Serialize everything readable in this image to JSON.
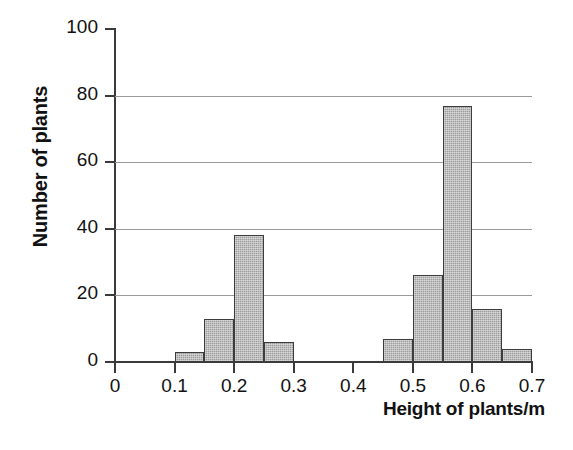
{
  "chart_data": {
    "type": "bar",
    "title": "",
    "subtitle": "",
    "xlabel": "Height of plants/m",
    "ylabel": "Number of plants",
    "xlim": [
      0,
      0.7
    ],
    "ylim": [
      0,
      100
    ],
    "bin_width": 0.05,
    "grid": "horizontal",
    "legend": "none",
    "x_ticks": [
      "0",
      "0.1",
      "0.2",
      "0.3",
      "0.4",
      "0.5",
      "0.6",
      "0.7"
    ],
    "x_tick_values": [
      0,
      0.1,
      0.2,
      0.3,
      0.4,
      0.5,
      0.6,
      0.7
    ],
    "y_ticks": [
      "0",
      "20",
      "40",
      "60",
      "80",
      "100"
    ],
    "y_tick_values": [
      0,
      20,
      40,
      60,
      80,
      100
    ],
    "gridline_values": [
      20,
      40,
      60,
      80
    ],
    "bar_color": "#9d9d9d",
    "bar_edge_color": "#3c3c3c",
    "axis_color": "#3a3a3a",
    "grid_color": "#9a9a9a",
    "bins": [
      {
        "label": "0.10-0.15",
        "x0": 0.1,
        "x1": 0.15,
        "value": 3
      },
      {
        "label": "0.15-0.20",
        "x0": 0.15,
        "x1": 0.2,
        "value": 13
      },
      {
        "label": "0.20-0.25",
        "x0": 0.2,
        "x1": 0.25,
        "value": 38
      },
      {
        "label": "0.25-0.30",
        "x0": 0.25,
        "x1": 0.3,
        "value": 6
      },
      {
        "label": "0.45-0.50",
        "x0": 0.45,
        "x1": 0.5,
        "value": 7
      },
      {
        "label": "0.50-0.55",
        "x0": 0.5,
        "x1": 0.55,
        "value": 26
      },
      {
        "label": "0.55-0.60",
        "x0": 0.55,
        "x1": 0.6,
        "value": 77
      },
      {
        "label": "0.60-0.65",
        "x0": 0.6,
        "x1": 0.65,
        "value": 16
      },
      {
        "label": "0.65-0.70",
        "x0": 0.65,
        "x1": 0.7,
        "value": 4
      }
    ]
  }
}
